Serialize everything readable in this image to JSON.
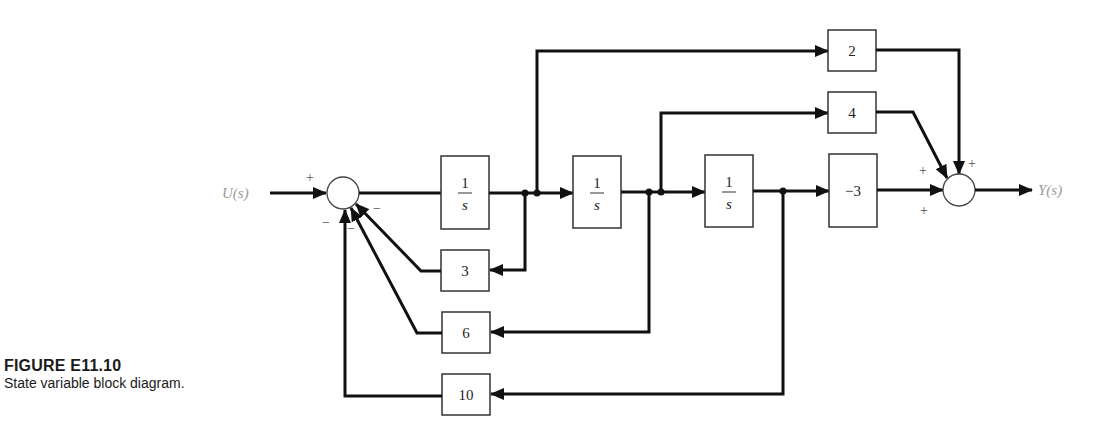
{
  "caption": {
    "title": "FIGURE E11.10",
    "text": "State variable block diagram."
  },
  "signals": {
    "input": "U(s)",
    "output": "Y(s)"
  },
  "summing_junctions": [
    {
      "id": "sum-input",
      "signs": {
        "input": "+",
        "fb3": "−",
        "fb6": "−",
        "fb10": "−"
      }
    },
    {
      "id": "sum-output",
      "signs": {
        "from2": "+",
        "from4": "+",
        "from_neg3": "+"
      }
    }
  ],
  "blocks": {
    "integrator1": {
      "num": "1",
      "den": "s"
    },
    "integrator2": {
      "num": "1",
      "den": "s"
    },
    "integrator3": {
      "num": "1",
      "den": "s"
    },
    "gain_2": "2",
    "gain_4": "4",
    "gain_neg3": "−3",
    "feedback_3": "3",
    "feedback_6": "6",
    "feedback_10": "10"
  },
  "signs": {
    "plus": "+",
    "minus": "−"
  }
}
